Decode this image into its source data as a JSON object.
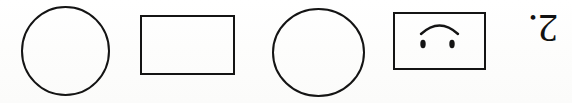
{
  "page": {
    "kind": "worksheet-shape-row",
    "orientation": "rotated-180",
    "background_color": "#fefefe",
    "ink_color": "#111111",
    "width": 572,
    "height": 103
  },
  "item": {
    "number_label": "2.",
    "number_value": "2"
  },
  "shapes": [
    {
      "index": 1,
      "name": "circle",
      "icon": "circle-outline-icon",
      "stroke_color": "#141414",
      "stroke_width": 2,
      "fill": "none",
      "bbox": {
        "x": 22,
        "y": 7,
        "width": 87,
        "height": 88
      }
    },
    {
      "index": 2,
      "name": "rectangle",
      "icon": "rectangle-outline-icon",
      "stroke_color": "#141414",
      "stroke_width": 2,
      "fill": "none",
      "bbox": {
        "x": 141,
        "y": 16,
        "width": 93,
        "height": 58
      }
    },
    {
      "index": 3,
      "name": "circle",
      "icon": "circle-outline-icon",
      "stroke_color": "#141414",
      "stroke_width": 2,
      "fill": "none",
      "bbox": {
        "x": 273,
        "y": 9,
        "width": 91,
        "height": 87
      }
    },
    {
      "index": 4,
      "name": "rectangle-with-face",
      "icon": "sad-face-box-icon",
      "stroke_color": "#141414",
      "stroke_width": 2,
      "fill": "none",
      "bbox": {
        "x": 394,
        "y": 13,
        "width": 91,
        "height": 56
      },
      "face": {
        "orientation": "inverted",
        "mouth": {
          "name": "arc-mouth",
          "shape": "arc-opening-down"
        },
        "eyes": [
          {
            "name": "eye-left",
            "cx": 423,
            "cy": 42,
            "rx": 2.6,
            "ry": 4.0
          },
          {
            "name": "eye-right",
            "cx": 452,
            "cy": 42,
            "rx": 2.6,
            "ry": 4.0
          }
        ]
      }
    }
  ]
}
